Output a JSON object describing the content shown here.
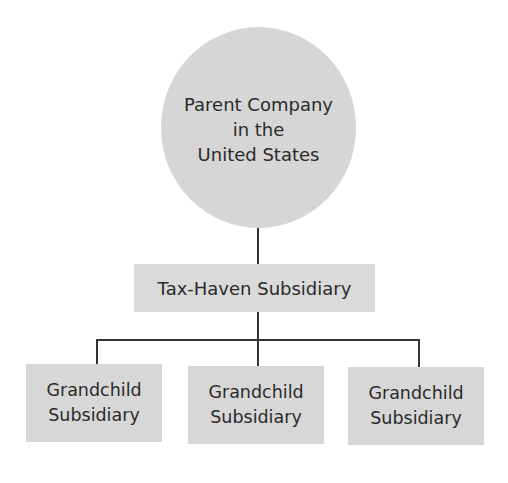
{
  "diagram": {
    "type": "org-chart",
    "colors": {
      "node_fill": "#d9d9d9",
      "connector": "#333333",
      "background": "#ffffff",
      "text": "#2a2a2a"
    },
    "parent": {
      "shape": "circle",
      "lines": [
        "Parent Company",
        "in the",
        "United States"
      ]
    },
    "middle": {
      "shape": "rectangle",
      "label": "Tax-Haven Subsidiary"
    },
    "children": [
      {
        "shape": "rectangle",
        "lines": [
          "Grandchild",
          "Subsidiary"
        ]
      },
      {
        "shape": "rectangle",
        "lines": [
          "Grandchild",
          "Subsidiary"
        ]
      },
      {
        "shape": "rectangle",
        "lines": [
          "Grandchild",
          "Subsidiary"
        ]
      }
    ],
    "edges": [
      {
        "from": "Parent Company in the United States",
        "to": "Tax-Haven Subsidiary"
      },
      {
        "from": "Tax-Haven Subsidiary",
        "to": "Grandchild Subsidiary 1"
      },
      {
        "from": "Tax-Haven Subsidiary",
        "to": "Grandchild Subsidiary 2"
      },
      {
        "from": "Tax-Haven Subsidiary",
        "to": "Grandchild Subsidiary 3"
      }
    ]
  }
}
